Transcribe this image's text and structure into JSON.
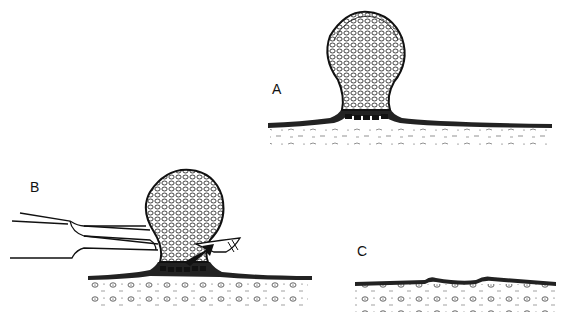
{
  "figure": {
    "panels": [
      {
        "id": "A",
        "label": "A",
        "description": "Pedunculated lesion on narrow stalk attached to skin surface"
      },
      {
        "id": "B",
        "label": "B",
        "description": "Forceps grasping lesion; scissors cutting at base of stalk"
      },
      {
        "id": "C",
        "label": "C",
        "description": "Skin surface after excision with small shallow defect"
      }
    ],
    "colors": {
      "ink": "#111111",
      "background": "#ffffff"
    }
  }
}
